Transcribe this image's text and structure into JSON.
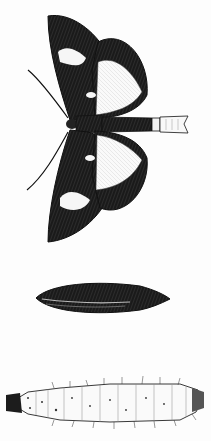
{
  "figure": {
    "type": "engraved natural-history illustration",
    "subjects": [
      {
        "id": "adult-moth",
        "label": "Adult moth (dorsal view, wings spread)"
      },
      {
        "id": "pupa",
        "label": "Pupa"
      },
      {
        "id": "larva",
        "label": "Larva / caterpillar"
      }
    ],
    "cropped_header_text": ""
  },
  "colors": {
    "ink": "#141414",
    "paper": "#fdfdfd",
    "light_patch": "#f4f4f4"
  }
}
